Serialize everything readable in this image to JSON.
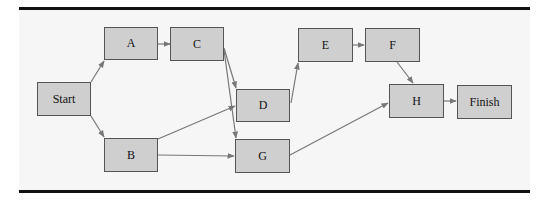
{
  "diagram": {
    "title": "",
    "nodes": [
      {
        "id": "start",
        "label": "Start",
        "x": 37,
        "y": 82,
        "w": 54,
        "h": 34
      },
      {
        "id": "A",
        "label": "A",
        "x": 104,
        "y": 27,
        "w": 54,
        "h": 33
      },
      {
        "id": "B",
        "label": "B",
        "x": 104,
        "y": 138,
        "w": 54,
        "h": 34
      },
      {
        "id": "C",
        "label": "C",
        "x": 170,
        "y": 27,
        "w": 54,
        "h": 34
      },
      {
        "id": "D",
        "label": "D",
        "x": 236,
        "y": 89,
        "w": 54,
        "h": 33
      },
      {
        "id": "G",
        "label": "G",
        "x": 235,
        "y": 139,
        "w": 55,
        "h": 34
      },
      {
        "id": "E",
        "label": "E",
        "x": 298,
        "y": 28,
        "w": 55,
        "h": 34
      },
      {
        "id": "F",
        "label": "F",
        "x": 365,
        "y": 28,
        "w": 55,
        "h": 34
      },
      {
        "id": "H",
        "label": "H",
        "x": 389,
        "y": 84,
        "w": 55,
        "h": 34
      },
      {
        "id": "finish",
        "label": "Finish",
        "x": 457,
        "y": 85,
        "w": 55,
        "h": 34
      }
    ],
    "edges": [
      {
        "from": "start",
        "to": "A"
      },
      {
        "from": "start",
        "to": "B"
      },
      {
        "from": "A",
        "to": "C"
      },
      {
        "from": "C",
        "to": "D"
      },
      {
        "from": "C",
        "to": "G"
      },
      {
        "from": "B",
        "to": "D"
      },
      {
        "from": "B",
        "to": "G"
      },
      {
        "from": "D",
        "to": "E"
      },
      {
        "from": "E",
        "to": "F"
      },
      {
        "from": "F",
        "to": "H"
      },
      {
        "from": "G",
        "to": "H"
      },
      {
        "from": "H",
        "to": "finish"
      }
    ],
    "colors": {
      "node_fill": "#cfcfcf",
      "node_border": "#555555",
      "edge": "#777777",
      "rule": "#111111"
    }
  }
}
